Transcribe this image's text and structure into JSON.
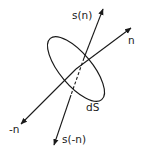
{
  "diagram": {
    "labels": {
      "s_n": "s(n)",
      "n": "n",
      "minus_n": "-n",
      "s_minus_n": "s(-n)",
      "dS": "dS"
    },
    "colors": {
      "stroke": "#1a1a1a",
      "background": "#ffffff"
    }
  }
}
